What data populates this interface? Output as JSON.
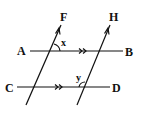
{
  "diagram": {
    "type": "parallel-lines-transversals",
    "points": {
      "A": "A",
      "B": "B",
      "C": "C",
      "D": "D",
      "F": "F",
      "H": "H"
    },
    "angles": {
      "x": "x",
      "y": "y"
    },
    "lines": [
      {
        "name": "AB",
        "from": "A",
        "to": "B",
        "parallel_mark": ">>"
      },
      {
        "name": "CD",
        "from": "C",
        "to": "D",
        "parallel_mark": ">>"
      },
      {
        "name": "left-transversal",
        "toward": "F",
        "arrow": true
      },
      {
        "name": "right-transversal",
        "toward": "H",
        "arrow": true
      }
    ],
    "colors": {
      "stroke": "#111111",
      "background": "#ffffff"
    }
  }
}
